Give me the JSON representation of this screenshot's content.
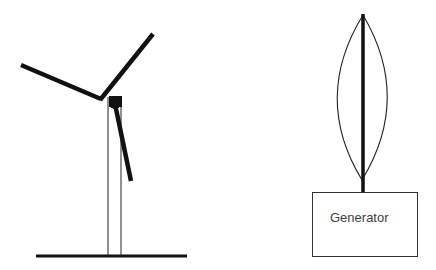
{
  "diagram": {
    "left_figure": {
      "name": "horizontal-axis-wind-turbine",
      "parts": [
        "ground",
        "tower",
        "hub",
        "blade-1",
        "blade-2",
        "blade-3"
      ]
    },
    "right_figure": {
      "name": "vertical-axis-wind-turbine",
      "parts": [
        "shaft",
        "curved-blade-left",
        "curved-blade-right",
        "generator-box"
      ],
      "generator_label": "Generator"
    },
    "colors": {
      "stroke": "#111111",
      "text": "#404040",
      "background": "#ffffff"
    }
  }
}
